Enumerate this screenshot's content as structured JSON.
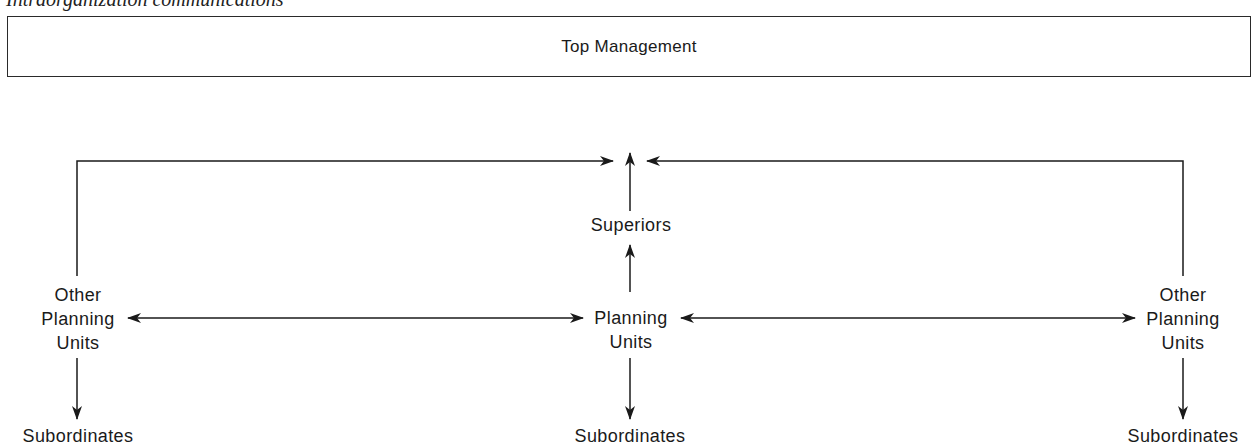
{
  "caption": "Intraorganization communications",
  "top_box": {
    "label": "Top Management"
  },
  "nodes": {
    "superiors": {
      "label": "Superiors"
    },
    "center_unit": {
      "lines": [
        "Planning",
        "Units"
      ]
    },
    "left_unit": {
      "lines": [
        "Other",
        "Planning",
        "Units"
      ]
    },
    "right_unit": {
      "lines": [
        "Other",
        "Planning",
        "Units"
      ]
    },
    "left_subordinates": {
      "label": "Subordinates"
    },
    "center_subordinates": {
      "label": "Subordinates"
    },
    "right_subordinates": {
      "label": "Subordinates"
    }
  },
  "edges": [
    {
      "from": "left_unit",
      "to": "superiors_top",
      "type": "elbow-arrow"
    },
    {
      "from": "right_unit",
      "to": "superiors_top",
      "type": "elbow-arrow"
    },
    {
      "from": "superiors",
      "to": "top",
      "type": "arrow-up"
    },
    {
      "from": "center_unit",
      "to": "superiors",
      "type": "arrow-up"
    },
    {
      "from": "left_unit",
      "to": "center_unit",
      "type": "bidirectional"
    },
    {
      "from": "center_unit",
      "to": "right_unit",
      "type": "bidirectional"
    },
    {
      "from": "left_unit",
      "to": "left_subordinates",
      "type": "arrow-down"
    },
    {
      "from": "center_unit",
      "to": "center_subordinates",
      "type": "arrow-down"
    },
    {
      "from": "right_unit",
      "to": "right_subordinates",
      "type": "arrow-down"
    }
  ],
  "colors": {
    "line": "#1a1a1a",
    "background": "#ffffff"
  }
}
